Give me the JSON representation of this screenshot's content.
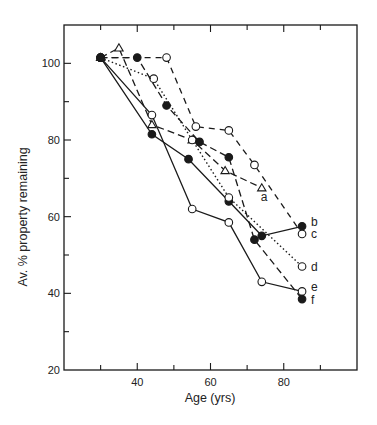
{
  "chart_data": {
    "type": "line",
    "title": "",
    "xlabel": "Age (yrs)",
    "ylabel": "Av. % property remaining",
    "xlim": [
      20,
      100
    ],
    "ylim": [
      20,
      110
    ],
    "x_ticks_major": [
      40,
      60,
      80
    ],
    "x_ticks_minor": [
      30,
      50,
      70,
      90
    ],
    "y_ticks_major": [
      20,
      40,
      60,
      80,
      100
    ],
    "y_ticks_minor": [
      30,
      50,
      70,
      90
    ],
    "grid": false,
    "legend": "inline end-of-line labels",
    "series": [
      {
        "name": "a",
        "marker": "open-triangle",
        "line": "dashed",
        "x": [
          30,
          35,
          44,
          55,
          64,
          74
        ],
        "y": [
          101.5,
          104,
          84,
          80,
          72,
          67.5
        ]
      },
      {
        "name": "b",
        "marker": "filled-circle",
        "line": "solid",
        "x": [
          30,
          44,
          54,
          65,
          74,
          85
        ],
        "y": [
          101.5,
          81.5,
          75,
          64,
          55,
          57.5
        ]
      },
      {
        "name": "c",
        "marker": "open-circle",
        "line": "long-dash",
        "x": [
          30,
          48,
          56,
          65,
          72,
          85
        ],
        "y": [
          101.5,
          101.5,
          83.5,
          82.5,
          73.5,
          55.5
        ]
      },
      {
        "name": "d",
        "marker": "open-circle",
        "line": "dotted",
        "x": [
          30,
          44.5,
          55,
          65,
          85
        ],
        "y": [
          101.5,
          96,
          80,
          65,
          47
        ]
      },
      {
        "name": "e",
        "marker": "open-circle",
        "line": "solid",
        "x": [
          30,
          44,
          55,
          65,
          74,
          85
        ],
        "y": [
          101.5,
          86.5,
          62,
          58.5,
          43,
          40.5
        ]
      },
      {
        "name": "f",
        "marker": "filled-circle",
        "line": "dashed",
        "x": [
          30,
          40,
          48,
          57,
          65,
          72,
          85
        ],
        "y": [
          101.5,
          101.5,
          89,
          79.5,
          75.5,
          54,
          38.5
        ]
      }
    ]
  }
}
